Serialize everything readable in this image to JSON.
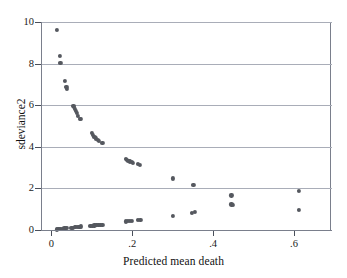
{
  "chart_data": {
    "type": "scatter",
    "title": "",
    "xlabel": "Predicted mean death",
    "ylabel": "sdeviance2",
    "xlim": [
      -0.0255,
      0.6915
    ],
    "ylim": [
      0,
      10
    ],
    "xticks": [
      0,
      0.2,
      0.4,
      0.6
    ],
    "xticklabels": [
      "0",
      ".2",
      ".4",
      ".6"
    ],
    "yticks": [
      0,
      2,
      4,
      6,
      8,
      10
    ],
    "yticklabels": [
      "0",
      "2",
      "4",
      "6",
      "8",
      "10"
    ],
    "grid": "horizontal",
    "legend": "none",
    "marker": {
      "shape": "circle",
      "color": "#55585f",
      "size": 4.2
    },
    "points": [
      {
        "x": 0.012,
        "y": 9.62
      },
      {
        "x": 0.019,
        "y": 8.38
      },
      {
        "x": 0.02,
        "y": 8.05
      },
      {
        "x": 0.032,
        "y": 7.15
      },
      {
        "x": 0.035,
        "y": 6.88
      },
      {
        "x": 0.036,
        "y": 6.8
      },
      {
        "x": 0.052,
        "y": 5.98
      },
      {
        "x": 0.054,
        "y": 5.92
      },
      {
        "x": 0.056,
        "y": 5.84
      },
      {
        "x": 0.058,
        "y": 5.74
      },
      {
        "x": 0.061,
        "y": 5.62
      },
      {
        "x": 0.064,
        "y": 5.5
      },
      {
        "x": 0.069,
        "y": 5.36
      },
      {
        "x": 0.071,
        "y": 5.33
      },
      {
        "x": 0.097,
        "y": 4.66
      },
      {
        "x": 0.1,
        "y": 4.58
      },
      {
        "x": 0.104,
        "y": 4.48
      },
      {
        "x": 0.108,
        "y": 4.4
      },
      {
        "x": 0.112,
        "y": 4.33
      },
      {
        "x": 0.116,
        "y": 4.27
      },
      {
        "x": 0.124,
        "y": 4.2
      },
      {
        "x": 0.182,
        "y": 3.42
      },
      {
        "x": 0.185,
        "y": 3.38
      },
      {
        "x": 0.188,
        "y": 3.34
      },
      {
        "x": 0.192,
        "y": 3.3
      },
      {
        "x": 0.196,
        "y": 3.26
      },
      {
        "x": 0.2,
        "y": 3.22
      },
      {
        "x": 0.212,
        "y": 3.16
      },
      {
        "x": 0.216,
        "y": 3.14
      },
      {
        "x": 0.299,
        "y": 2.48
      },
      {
        "x": 0.349,
        "y": 2.15
      },
      {
        "x": 0.443,
        "y": 1.66
      },
      {
        "x": 0.443,
        "y": 1.23
      },
      {
        "x": 0.447,
        "y": 1.22
      },
      {
        "x": 0.61,
        "y": 1.89
      },
      {
        "x": 0.61,
        "y": 0.96
      },
      {
        "x": 0.012,
        "y": 0.03
      },
      {
        "x": 0.015,
        "y": 0.04
      },
      {
        "x": 0.019,
        "y": 0.05
      },
      {
        "x": 0.022,
        "y": 0.06
      },
      {
        "x": 0.026,
        "y": 0.07
      },
      {
        "x": 0.03,
        "y": 0.08
      },
      {
        "x": 0.033,
        "y": 0.09
      },
      {
        "x": 0.037,
        "y": 0.1
      },
      {
        "x": 0.047,
        "y": 0.11
      },
      {
        "x": 0.051,
        "y": 0.12
      },
      {
        "x": 0.055,
        "y": 0.13
      },
      {
        "x": 0.059,
        "y": 0.14
      },
      {
        "x": 0.063,
        "y": 0.15
      },
      {
        "x": 0.067,
        "y": 0.16
      },
      {
        "x": 0.071,
        "y": 0.17
      },
      {
        "x": 0.094,
        "y": 0.2
      },
      {
        "x": 0.099,
        "y": 0.21
      },
      {
        "x": 0.104,
        "y": 0.22
      },
      {
        "x": 0.109,
        "y": 0.23
      },
      {
        "x": 0.114,
        "y": 0.24
      },
      {
        "x": 0.119,
        "y": 0.25
      },
      {
        "x": 0.124,
        "y": 0.26
      },
      {
        "x": 0.182,
        "y": 0.41
      },
      {
        "x": 0.187,
        "y": 0.42
      },
      {
        "x": 0.192,
        "y": 0.43
      },
      {
        "x": 0.197,
        "y": 0.44
      },
      {
        "x": 0.212,
        "y": 0.47
      },
      {
        "x": 0.218,
        "y": 0.48
      },
      {
        "x": 0.299,
        "y": 0.68
      },
      {
        "x": 0.345,
        "y": 0.84
      },
      {
        "x": 0.352,
        "y": 0.86
      }
    ]
  }
}
